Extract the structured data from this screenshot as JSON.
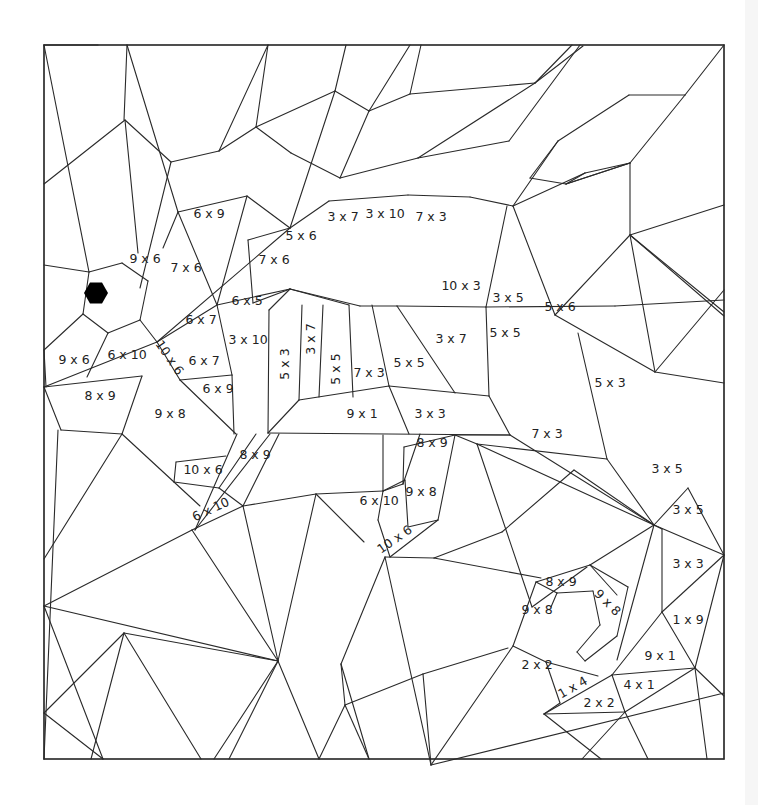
{
  "worksheet": {
    "subject": "seahorse",
    "frame": {
      "x": 44,
      "y": 45,
      "w": 680,
      "h": 714
    },
    "eye": {
      "cx": 96,
      "cy": 293,
      "r": 12
    },
    "labels": [
      {
        "text": "6 x 9",
        "x": 209,
        "y": 214,
        "rot": 0
      },
      {
        "text": "9 x 6",
        "x": 145,
        "y": 259,
        "rot": 0
      },
      {
        "text": "7 x 6",
        "x": 186,
        "y": 268,
        "rot": 0
      },
      {
        "text": "7 x 6",
        "x": 274,
        "y": 260,
        "rot": 0
      },
      {
        "text": "5 x 6",
        "x": 301,
        "y": 236,
        "rot": 0
      },
      {
        "text": "3 x 7",
        "x": 343,
        "y": 217,
        "rot": 0
      },
      {
        "text": "3 x 10",
        "x": 385,
        "y": 214,
        "rot": 0
      },
      {
        "text": "7 x 3",
        "x": 431,
        "y": 217,
        "rot": 0
      },
      {
        "text": "6 x 5",
        "x": 247,
        "y": 301,
        "rot": 0
      },
      {
        "text": "6 x 7",
        "x": 201,
        "y": 320,
        "rot": 0
      },
      {
        "text": "3 x 10",
        "x": 248,
        "y": 340,
        "rot": 0
      },
      {
        "text": "10 x 3",
        "x": 461,
        "y": 286,
        "rot": 0
      },
      {
        "text": "3 x 5",
        "x": 508,
        "y": 298,
        "rot": 0
      },
      {
        "text": "5 x 6",
        "x": 560,
        "y": 307,
        "rot": 0
      },
      {
        "text": "9 x 6",
        "x": 74,
        "y": 360,
        "rot": 0
      },
      {
        "text": "6 x 10",
        "x": 127,
        "y": 355,
        "rot": 0
      },
      {
        "text": "10 x 6",
        "x": 169,
        "y": 358,
        "rot": 55
      },
      {
        "text": "6 x 7",
        "x": 204,
        "y": 361,
        "rot": 0
      },
      {
        "text": "6 x 9",
        "x": 218,
        "y": 389,
        "rot": 0
      },
      {
        "text": "5 x 3",
        "x": 285,
        "y": 364,
        "rot": -90
      },
      {
        "text": "3 x 7",
        "x": 311,
        "y": 339,
        "rot": -90
      },
      {
        "text": "5 x 5",
        "x": 336,
        "y": 369,
        "rot": -90
      },
      {
        "text": "7 x 3",
        "x": 369,
        "y": 373,
        "rot": 0
      },
      {
        "text": "5 x 5",
        "x": 409,
        "y": 363,
        "rot": 0
      },
      {
        "text": "3 x 7",
        "x": 451,
        "y": 339,
        "rot": 0
      },
      {
        "text": "5 x 5",
        "x": 505,
        "y": 333,
        "rot": 0
      },
      {
        "text": "5 x 3",
        "x": 610,
        "y": 383,
        "rot": 0
      },
      {
        "text": "8 x 9",
        "x": 100,
        "y": 396,
        "rot": 0
      },
      {
        "text": "9 x 8",
        "x": 170,
        "y": 414,
        "rot": 0
      },
      {
        "text": "9 x 1",
        "x": 362,
        "y": 414,
        "rot": 0
      },
      {
        "text": "3 x 3",
        "x": 430,
        "y": 414,
        "rot": 0
      },
      {
        "text": "7 x 3",
        "x": 547,
        "y": 434,
        "rot": 0
      },
      {
        "text": "8 x 9",
        "x": 255,
        "y": 455,
        "rot": 0
      },
      {
        "text": "10 x 6",
        "x": 203,
        "y": 470,
        "rot": 0
      },
      {
        "text": "8 x 9",
        "x": 432,
        "y": 443,
        "rot": 0
      },
      {
        "text": "9 x 8",
        "x": 421,
        "y": 492,
        "rot": 0
      },
      {
        "text": "6 x 10",
        "x": 379,
        "y": 501,
        "rot": 0
      },
      {
        "text": "6 x 10",
        "x": 211,
        "y": 510,
        "rot": -25
      },
      {
        "text": "10 x 6",
        "x": 395,
        "y": 540,
        "rot": -35
      },
      {
        "text": "3 x 5",
        "x": 667,
        "y": 469,
        "rot": 0
      },
      {
        "text": "3 x 5",
        "x": 688,
        "y": 510,
        "rot": 0
      },
      {
        "text": "3 x 3",
        "x": 688,
        "y": 564,
        "rot": 0
      },
      {
        "text": "8 x 9",
        "x": 561,
        "y": 582,
        "rot": 0
      },
      {
        "text": "9 x 8",
        "x": 537,
        "y": 610,
        "rot": 0
      },
      {
        "text": "9 x 8",
        "x": 607,
        "y": 603,
        "rot": 45
      },
      {
        "text": "1 x 9",
        "x": 688,
        "y": 620,
        "rot": 0
      },
      {
        "text": "9 x 1",
        "x": 660,
        "y": 656,
        "rot": 0
      },
      {
        "text": "2 x 2",
        "x": 537,
        "y": 665,
        "rot": 0
      },
      {
        "text": "1 x 4",
        "x": 573,
        "y": 688,
        "rot": -30
      },
      {
        "text": "4 x 1",
        "x": 639,
        "y": 685,
        "rot": 0
      },
      {
        "text": "2 x 2",
        "x": 599,
        "y": 703,
        "rot": 0
      }
    ],
    "edges": [
      [
        44,
        45,
        98,
        45
      ],
      [
        44,
        45,
        44,
        759
      ],
      [
        44,
        759,
        724,
        759
      ],
      [
        724,
        759,
        724,
        45
      ],
      [
        44,
        45,
        724,
        45
      ],
      [
        44,
        45,
        89,
        272
      ],
      [
        44,
        184,
        125,
        120
      ],
      [
        125,
        120,
        138,
        253
      ],
      [
        125,
        120,
        171,
        162
      ],
      [
        171,
        162,
        140,
        288
      ],
      [
        127,
        45,
        124,
        120
      ],
      [
        127,
        45,
        178,
        212
      ],
      [
        178,
        212,
        163,
        248
      ],
      [
        171,
        162,
        219,
        151
      ],
      [
        219,
        151,
        256,
        127
      ],
      [
        256,
        127,
        268,
        45
      ],
      [
        219,
        151,
        268,
        45
      ],
      [
        178,
        212,
        247,
        196
      ],
      [
        247,
        196,
        217,
        305
      ],
      [
        178,
        212,
        217,
        305
      ],
      [
        256,
        127,
        335,
        91
      ],
      [
        335,
        91,
        369,
        111
      ],
      [
        369,
        111,
        410,
        94
      ],
      [
        335,
        91,
        346,
        45
      ],
      [
        369,
        111,
        410,
        45
      ],
      [
        410,
        94,
        535,
        83
      ],
      [
        256,
        127,
        291,
        153
      ],
      [
        291,
        153,
        340,
        178
      ],
      [
        340,
        178,
        369,
        111
      ],
      [
        340,
        178,
        418,
        158
      ],
      [
        418,
        158,
        535,
        83
      ],
      [
        535,
        83,
        583,
        46
      ],
      [
        410,
        94,
        421,
        45
      ],
      [
        535,
        83,
        572,
        45
      ],
      [
        418,
        158,
        509,
        141
      ],
      [
        509,
        141,
        580,
        45
      ],
      [
        335,
        91,
        290,
        228
      ],
      [
        290,
        228,
        247,
        196
      ],
      [
        248,
        240,
        290,
        228
      ],
      [
        290,
        228,
        329,
        201
      ],
      [
        329,
        201,
        408,
        195
      ],
      [
        408,
        195,
        470,
        197
      ],
      [
        470,
        197,
        513,
        206
      ],
      [
        513,
        206,
        585,
        173
      ],
      [
        585,
        173,
        630,
        163
      ],
      [
        630,
        163,
        685,
        95
      ],
      [
        685,
        95,
        724,
        45
      ],
      [
        513,
        206,
        558,
        141
      ],
      [
        558,
        141,
        629,
        95
      ],
      [
        629,
        95,
        685,
        95
      ],
      [
        585,
        173,
        566,
        184
      ],
      [
        566,
        184,
        630,
        163
      ],
      [
        558,
        141,
        530,
        178
      ],
      [
        530,
        178,
        566,
        184
      ],
      [
        566,
        184,
        630,
        163
      ],
      [
        630,
        163,
        630,
        235
      ],
      [
        630,
        235,
        724,
        205
      ],
      [
        630,
        235,
        724,
        316
      ],
      [
        630,
        235,
        724,
        312
      ],
      [
        513,
        206,
        555,
        315
      ],
      [
        555,
        315,
        630,
        235
      ],
      [
        555,
        315,
        655,
        372
      ],
      [
        655,
        372,
        724,
        383
      ],
      [
        655,
        372,
        630,
        235
      ],
      [
        655,
        372,
        724,
        290
      ],
      [
        89,
        272,
        83,
        314
      ],
      [
        83,
        314,
        108,
        333
      ],
      [
        108,
        333,
        140,
        320
      ],
      [
        140,
        320,
        148,
        281
      ],
      [
        148,
        281,
        122,
        263
      ],
      [
        122,
        263,
        89,
        272
      ],
      [
        44,
        265,
        89,
        272
      ],
      [
        83,
        314,
        44,
        350
      ],
      [
        44,
        350,
        46,
        387
      ],
      [
        108,
        333,
        87,
        377
      ],
      [
        140,
        320,
        157,
        342
      ],
      [
        157,
        342,
        217,
        305
      ],
      [
        157,
        342,
        180,
        380
      ],
      [
        180,
        380,
        232,
        375
      ],
      [
        157,
        342,
        290,
        228
      ],
      [
        157,
        342,
        44,
        387
      ],
      [
        44,
        387,
        61,
        430
      ],
      [
        61,
        430,
        122,
        434
      ],
      [
        122,
        434,
        142,
        376
      ],
      [
        142,
        376,
        44,
        387
      ],
      [
        180,
        380,
        236,
        434
      ],
      [
        232,
        375,
        234,
        434
      ],
      [
        217,
        305,
        232,
        375
      ],
      [
        217,
        305,
        290,
        289
      ],
      [
        290,
        289,
        269,
        310
      ],
      [
        269,
        310,
        268,
        433
      ],
      [
        248,
        240,
        253,
        303
      ],
      [
        253,
        303,
        290,
        289
      ],
      [
        290,
        289,
        360,
        306
      ],
      [
        360,
        306,
        397,
        306
      ],
      [
        397,
        306,
        486,
        307
      ],
      [
        486,
        307,
        615,
        306
      ],
      [
        615,
        306,
        724,
        300
      ],
      [
        290,
        289,
        349,
        305
      ],
      [
        302,
        305,
        299,
        400
      ],
      [
        299,
        400,
        268,
        433
      ],
      [
        323,
        305,
        319,
        397
      ],
      [
        349,
        305,
        353,
        397
      ],
      [
        372,
        305,
        389,
        386
      ],
      [
        397,
        306,
        455,
        393
      ],
      [
        486,
        307,
        489,
        396
      ],
      [
        489,
        396,
        510,
        435
      ],
      [
        486,
        307,
        507,
        206
      ],
      [
        299,
        400,
        389,
        386
      ],
      [
        389,
        386,
        489,
        396
      ],
      [
        389,
        386,
        409,
        434
      ],
      [
        268,
        433,
        510,
        435
      ],
      [
        44,
        559,
        122,
        434
      ],
      [
        122,
        434,
        200,
        506
      ],
      [
        44,
        759,
        58,
        430
      ],
      [
        270,
        434,
        195,
        530
      ],
      [
        237,
        434,
        195,
        530
      ],
      [
        176,
        462,
        226,
        456
      ],
      [
        176,
        462,
        174,
        482
      ],
      [
        174,
        482,
        219,
        488
      ],
      [
        219,
        488,
        256,
        434
      ],
      [
        219,
        488,
        243,
        506
      ],
      [
        243,
        506,
        192,
        530
      ],
      [
        243,
        506,
        279,
        434
      ],
      [
        243,
        506,
        278,
        661
      ],
      [
        192,
        530,
        278,
        661
      ],
      [
        192,
        530,
        44,
        606
      ],
      [
        243,
        506,
        316,
        494
      ],
      [
        316,
        494,
        383,
        491
      ],
      [
        316,
        494,
        278,
        661
      ],
      [
        316,
        494,
        364,
        542
      ],
      [
        383,
        491,
        383,
        435
      ],
      [
        383,
        491,
        403,
        484
      ],
      [
        403,
        484,
        420,
        434
      ],
      [
        403,
        484,
        404,
        447
      ],
      [
        404,
        447,
        455,
        435
      ],
      [
        383,
        491,
        405,
        480
      ],
      [
        405,
        480,
        408,
        527
      ],
      [
        408,
        527,
        438,
        520
      ],
      [
        438,
        520,
        455,
        435
      ],
      [
        383,
        491,
        378,
        520
      ],
      [
        378,
        520,
        390,
        557
      ],
      [
        390,
        557,
        438,
        520
      ],
      [
        455,
        435,
        477,
        444
      ],
      [
        477,
        444,
        654,
        525
      ],
      [
        455,
        435,
        510,
        435
      ],
      [
        510,
        435,
        654,
        525
      ],
      [
        477,
        444,
        532,
        607
      ],
      [
        532,
        607,
        587,
        567
      ],
      [
        477,
        444,
        607,
        459
      ],
      [
        607,
        459,
        654,
        525
      ],
      [
        607,
        459,
        578,
        333
      ],
      [
        434,
        558,
        541,
        578
      ],
      [
        434,
        558,
        502,
        532
      ],
      [
        502,
        532,
        574,
        470
      ],
      [
        574,
        470,
        654,
        525
      ],
      [
        385,
        557,
        434,
        558
      ],
      [
        385,
        557,
        341,
        664
      ],
      [
        341,
        664,
        369,
        759
      ],
      [
        385,
        557,
        431,
        765
      ],
      [
        278,
        661,
        44,
        606
      ],
      [
        278,
        661,
        214,
        759
      ],
      [
        278,
        661,
        229,
        759
      ],
      [
        278,
        661,
        319,
        759
      ],
      [
        44,
        713,
        103,
        759
      ],
      [
        44,
        606,
        103,
        759
      ],
      [
        44,
        713,
        124,
        633
      ],
      [
        124,
        633,
        91,
        759
      ],
      [
        124,
        633,
        201,
        759
      ],
      [
        124,
        633,
        278,
        661
      ],
      [
        319,
        759,
        345,
        705
      ],
      [
        345,
        705,
        369,
        759
      ],
      [
        341,
        664,
        345,
        705
      ],
      [
        345,
        705,
        423,
        674
      ],
      [
        423,
        674,
        508,
        648
      ],
      [
        423,
        674,
        431,
        765
      ],
      [
        431,
        765,
        513,
        646
      ],
      [
        513,
        646,
        536,
        582
      ],
      [
        431,
        765,
        724,
        693
      ],
      [
        513,
        646,
        546,
        662
      ],
      [
        546,
        662,
        560,
        703
      ],
      [
        546,
        662,
        598,
        676
      ],
      [
        536,
        582,
        590,
        565
      ],
      [
        590,
        565,
        617,
        595
      ],
      [
        536,
        582,
        557,
        593
      ],
      [
        557,
        593,
        551,
        607
      ],
      [
        557,
        593,
        593,
        591
      ],
      [
        593,
        591,
        600,
        625
      ],
      [
        600,
        625,
        577,
        652
      ],
      [
        577,
        652,
        585,
        661
      ],
      [
        585,
        661,
        617,
        636
      ],
      [
        617,
        636,
        628,
        587
      ],
      [
        590,
        565,
        628,
        587
      ],
      [
        590,
        565,
        654,
        525
      ],
      [
        654,
        525,
        688,
        488
      ],
      [
        688,
        488,
        724,
        555
      ],
      [
        654,
        525,
        724,
        555
      ],
      [
        654,
        525,
        662,
        529
      ],
      [
        662,
        529,
        662,
        612
      ],
      [
        662,
        612,
        724,
        555
      ],
      [
        654,
        525,
        617,
        660
      ],
      [
        662,
        612,
        695,
        668
      ],
      [
        695,
        668,
        724,
        555
      ],
      [
        612,
        675,
        695,
        668
      ],
      [
        612,
        675,
        544,
        714
      ],
      [
        544,
        714,
        560,
        703
      ],
      [
        544,
        714,
        625,
        712
      ],
      [
        625,
        712,
        695,
        668
      ],
      [
        695,
        668,
        707,
        759
      ],
      [
        695,
        668,
        724,
        696
      ],
      [
        612,
        675,
        625,
        712
      ],
      [
        625,
        712,
        582,
        759
      ],
      [
        625,
        712,
        648,
        759
      ],
      [
        544,
        714,
        601,
        759
      ],
      [
        662,
        612,
        612,
        675
      ]
    ]
  }
}
